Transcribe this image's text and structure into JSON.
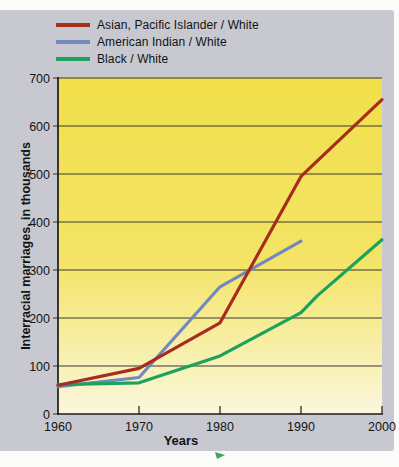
{
  "legend": {
    "items": [
      {
        "label": "Asian, Pacific Islander / White",
        "color": "#a62c1e"
      },
      {
        "label": "American Indian / White",
        "color": "#7289be"
      },
      {
        "label": "Black / White",
        "color": "#1ca25d"
      }
    ]
  },
  "chart_data": {
    "type": "line",
    "title": "",
    "xlabel": "Years",
    "ylabel": "Interracial marriages, in thousands",
    "xlim": [
      1960,
      2000
    ],
    "ylim": [
      0,
      700
    ],
    "x_ticks": [
      1960,
      1970,
      1980,
      1990,
      2000
    ],
    "y_ticks": [
      0,
      100,
      200,
      300,
      400,
      500,
      600,
      700
    ],
    "grid": true,
    "legend_position": "top-left",
    "series": [
      {
        "name": "Asian, Pacific Islander / White",
        "color": "#a62c1e",
        "points": [
          [
            1960,
            60
          ],
          [
            1970,
            95
          ],
          [
            1980,
            190
          ],
          [
            1990,
            495
          ],
          [
            2000,
            655
          ]
        ]
      },
      {
        "name": "American Indian / White",
        "color": "#7289be",
        "points": [
          [
            1960,
            57
          ],
          [
            1970,
            76
          ],
          [
            1980,
            265
          ],
          [
            1990,
            360
          ]
        ]
      },
      {
        "name": "Black / White",
        "color": "#1ca25d",
        "points": [
          [
            1960,
            61
          ],
          [
            1970,
            65
          ],
          [
            1980,
            121
          ],
          [
            1990,
            211
          ],
          [
            1992,
            246
          ],
          [
            2000,
            363
          ]
        ]
      }
    ],
    "draw_order": [
      1,
      2,
      0
    ],
    "plot_background": {
      "top": "#f1df4a",
      "mid": "#f4e467",
      "bottom": "#faf7dc"
    }
  },
  "colors": {
    "card_bg": "#c8c8d0",
    "page_bg": "#fbfbfa",
    "grid_line": "#3a392f",
    "axis": "#1c1b15",
    "text": "#141414",
    "cursor_arrow": "#3fa45c"
  }
}
